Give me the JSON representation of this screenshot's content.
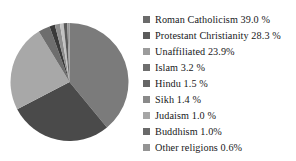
{
  "chart_data": {
    "type": "pie",
    "title": "",
    "legend_position": "right",
    "grid": false,
    "units": "percent",
    "categories": [
      "Roman Catholicism",
      "Protestant Christianity",
      "Unaffiliated",
      "Islam",
      "Hindu",
      "Sikh",
      "Judaism",
      "Buddhism",
      "Other religions"
    ],
    "values": [
      39.0,
      28.3,
      23.9,
      3.2,
      1.5,
      1.4,
      1.0,
      1.0,
      0.6
    ],
    "colors": [
      "#7b7b7b",
      "#4a4a4a",
      "#a8a8a8",
      "#6e6e6e",
      "#3a3a3a",
      "#8f8f8f",
      "#c2c2c2",
      "#5a5a5a",
      "#9a9a9a"
    ],
    "slice_labels": [
      "Roman Catholicism 39.0 %",
      "Protestant Christianity 28.3 %",
      "Unaffiliated 23.9%",
      "Islam 3.2 %",
      "Hindu 1.5 %",
      "Sikh 1.4 %",
      "Judaism 1.0 %",
      "Buddhism 1.0%",
      "Other religions 0.6%"
    ]
  },
  "legend": {
    "items": [
      {
        "label": "Roman Catholicism 39.0 %",
        "swatch": "#6b6b6b"
      },
      {
        "label": "Protestant Christianity 28.3 %",
        "swatch": "#5b5b5b"
      },
      {
        "label": "Unaffiliated 23.9%",
        "swatch": "#9c9c9c"
      },
      {
        "label": "Islam 3.2 %",
        "swatch": "#6e6e6e"
      },
      {
        "label": "Hindu 1.5 %",
        "swatch": "#666666"
      },
      {
        "label": "Sikh 1.4 %",
        "swatch": "#8a8a8a"
      },
      {
        "label": "Judaism 1.0 %",
        "swatch": "#a6a6a6"
      },
      {
        "label": "Buddhism 1.0%",
        "swatch": "#6a6a6a"
      },
      {
        "label": "Other religions 0.6%",
        "swatch": "#949494"
      }
    ]
  }
}
